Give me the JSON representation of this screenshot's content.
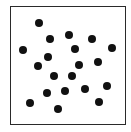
{
  "diagram": {
    "type": "dot-pattern",
    "frame": {
      "x": 10,
      "y": 6,
      "width": 114,
      "height": 117,
      "border_color": "#2a2a2a"
    },
    "dot_color": "#111111",
    "dot_diameter": 8,
    "dots": [
      {
        "x": 39,
        "y": 23
      },
      {
        "x": 50,
        "y": 39
      },
      {
        "x": 69,
        "y": 35
      },
      {
        "x": 92,
        "y": 39
      },
      {
        "x": 23,
        "y": 50
      },
      {
        "x": 75,
        "y": 49
      },
      {
        "x": 112,
        "y": 48
      },
      {
        "x": 48,
        "y": 57
      },
      {
        "x": 38,
        "y": 66
      },
      {
        "x": 79,
        "y": 65
      },
      {
        "x": 98,
        "y": 62
      },
      {
        "x": 54,
        "y": 76
      },
      {
        "x": 72,
        "y": 76
      },
      {
        "x": 47,
        "y": 93
      },
      {
        "x": 65,
        "y": 91
      },
      {
        "x": 85,
        "y": 89
      },
      {
        "x": 107,
        "y": 86
      },
      {
        "x": 30,
        "y": 103
      },
      {
        "x": 58,
        "y": 109
      },
      {
        "x": 99,
        "y": 102
      }
    ],
    "dot_count": 20
  }
}
